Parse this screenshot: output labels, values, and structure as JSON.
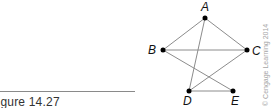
{
  "figure": {
    "caption": "Figure 14.27",
    "credit": "© Cengage Learning 2014"
  },
  "graph": {
    "nodes": [
      {
        "id": "A",
        "label": "A",
        "x": 205,
        "y": 18
      },
      {
        "id": "B",
        "label": "B",
        "x": 163,
        "y": 50
      },
      {
        "id": "C",
        "label": "C",
        "x": 247,
        "y": 50
      },
      {
        "id": "D",
        "label": "D",
        "x": 189,
        "y": 91
      },
      {
        "id": "E",
        "label": "E",
        "x": 233,
        "y": 91
      }
    ],
    "edges": [
      [
        "A",
        "B"
      ],
      [
        "A",
        "C"
      ],
      [
        "A",
        "D"
      ],
      [
        "B",
        "C"
      ],
      [
        "B",
        "E"
      ],
      [
        "C",
        "D"
      ],
      [
        "D",
        "E"
      ]
    ],
    "colors": {
      "edge": "#8c8c8c",
      "node": "#000000"
    }
  }
}
